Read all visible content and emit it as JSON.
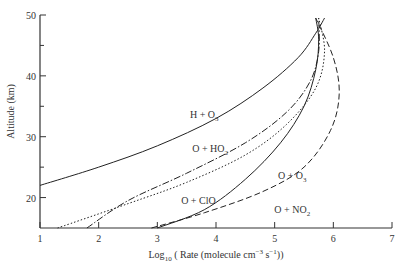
{
  "chart_data": {
    "type": "line",
    "title": "",
    "xlabel": "Log10 ( Rate (molecule cm^-3 s^-1))",
    "ylabel": "Altitude (km)",
    "xlim": [
      1,
      7
    ],
    "ylim": [
      15,
      50
    ],
    "xticks": [
      1,
      2,
      3,
      4,
      5,
      6,
      7
    ],
    "yticks": [
      20,
      30,
      40,
      50
    ],
    "grid": false,
    "legend": "inline labels",
    "series": [
      {
        "name": "H + O3",
        "style": "solid",
        "label_pos": [
          3.8,
          33
        ],
        "points": [
          [
            1.0,
            22
          ],
          [
            2.0,
            25
          ],
          [
            3.0,
            28.5
          ],
          [
            4.0,
            33
          ],
          [
            4.8,
            38
          ],
          [
            5.4,
            43
          ],
          [
            5.7,
            47
          ],
          [
            5.85,
            49.5
          ]
        ]
      },
      {
        "name": "O + HO2",
        "style": "dashdot",
        "label_pos": [
          3.9,
          27.5
        ],
        "points": [
          [
            1.8,
            15
          ],
          [
            2.5,
            19.5
          ],
          [
            3.5,
            24
          ],
          [
            4.5,
            29
          ],
          [
            5.2,
            34
          ],
          [
            5.6,
            39
          ],
          [
            5.75,
            44
          ],
          [
            5.75,
            49.5
          ]
        ]
      },
      {
        "name": "O + ClO",
        "style": "dotted",
        "label_pos": [
          3.7,
          19
        ],
        "points": [
          [
            1.3,
            15
          ],
          [
            2.5,
            19
          ],
          [
            3.5,
            22.5
          ],
          [
            4.5,
            27
          ],
          [
            5.2,
            32
          ],
          [
            5.7,
            38
          ],
          [
            5.85,
            44
          ],
          [
            5.75,
            49.5
          ]
        ]
      },
      {
        "name": "O + O3",
        "style": "solid",
        "label_pos": [
          5.3,
          23
        ],
        "points": [
          [
            3.0,
            15
          ],
          [
            3.8,
            18
          ],
          [
            4.5,
            23
          ],
          [
            5.1,
            29
          ],
          [
            5.5,
            35
          ],
          [
            5.7,
            41
          ],
          [
            5.75,
            46
          ],
          [
            5.7,
            49.5
          ]
        ]
      },
      {
        "name": "O + NO2",
        "style": "dashed",
        "label_pos": [
          5.3,
          17.5
        ],
        "points": [
          [
            2.9,
            15
          ],
          [
            3.8,
            17.5
          ],
          [
            4.8,
            21
          ],
          [
            5.5,
            25
          ],
          [
            5.95,
            31
          ],
          [
            6.1,
            37
          ],
          [
            6.0,
            43
          ],
          [
            5.7,
            49.5
          ]
        ]
      }
    ]
  }
}
